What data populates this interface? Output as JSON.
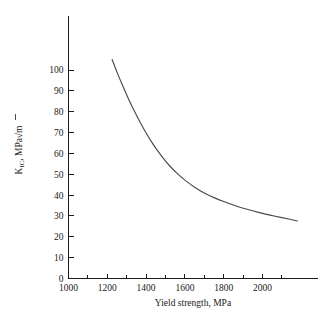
{
  "chart_data": {
    "type": "line",
    "title": "",
    "subtitle": "",
    "xlabel": "Yield strength, MPa",
    "ylabel": "K_IC, MPa√m",
    "ylabel_parts": {
      "symbol": "K",
      "subscript": "IC",
      "units_prefix": ", MPa",
      "radical": "√",
      "radicand": "m"
    },
    "xlim": [
      1000,
      2200
    ],
    "ylim": [
      0,
      108
    ],
    "xticks": [
      1000,
      1200,
      1400,
      1600,
      1800,
      2000
    ],
    "xtick_labels": [
      "1000",
      "1200",
      "1400",
      "1600",
      "1800",
      "2000"
    ],
    "x_minor_ticks": [
      1100,
      1300,
      1500,
      1700,
      1900,
      2100
    ],
    "yticks": [
      0,
      10,
      20,
      30,
      40,
      50,
      60,
      70,
      80,
      90,
      100
    ],
    "ytick_labels": [
      "0",
      "10",
      "20",
      "30",
      "40",
      "50",
      "60",
      "70",
      "80",
      "90",
      "100"
    ],
    "grid": false,
    "legend": false,
    "legend_position": "none",
    "series": [
      {
        "name": "fracture toughness",
        "color": "#4a4a4a",
        "x": [
          1225,
          1250,
          1280,
          1310,
          1340,
          1370,
          1400,
          1430,
          1460,
          1490,
          1520,
          1560,
          1600,
          1650,
          1700,
          1750,
          1800,
          1860,
          1920,
          1980,
          2040,
          2100,
          2180
        ],
        "y": [
          105.0,
          99.0,
          92.3,
          86.0,
          80.2,
          74.8,
          69.8,
          65.3,
          61.2,
          57.5,
          54.2,
          50.4,
          47.2,
          43.8,
          41.0,
          38.8,
          36.9,
          34.9,
          33.2,
          31.7,
          30.4,
          29.2,
          27.6
        ]
      }
    ]
  },
  "axes": {
    "x_axis_name": "x-axis",
    "y_axis_name": "y-axis"
  },
  "colors": {
    "curve": "#4a4a4a",
    "axis": "#1a1a1a",
    "background": "#ffffff"
  }
}
